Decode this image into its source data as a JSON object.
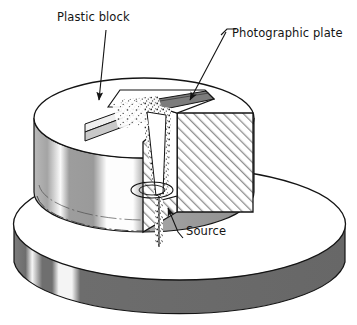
{
  "figure": {
    "width": 357,
    "height": 325,
    "background_color": "#ffffff",
    "line_color": "#141414"
  },
  "labels": [
    {
      "id": "plastic-block",
      "text": "Plastic block",
      "leader": "arrow",
      "points_to": "top face of upper cylindrical plastic block"
    },
    {
      "id": "photographic-plate",
      "text": "Photographic plate",
      "leader": "arrow",
      "points_to": "thin plate slab set into notch on top of block"
    },
    {
      "id": "source",
      "text": "Source",
      "leader": "arrow",
      "points_to": "small radioactive source at base of cut channel"
    }
  ],
  "parts": {
    "upper_block": {
      "name": "Plastic block",
      "shape": "cylinder",
      "face_color": "#fdfdfd",
      "side_color": "#9a9a9a",
      "highlight_color": "#fbfbfb"
    },
    "lower_platform": {
      "name": "Base platform",
      "shape": "cylinder",
      "face_color": "#fefefe",
      "side_color": "#6b6b6b",
      "highlight_color": "#f2f2f2"
    },
    "cutaway": {
      "name": "Sectioned quadrant",
      "fill": "hatched",
      "hatch_color": "#8c8c8c",
      "hatch_angle_deg": 45
    },
    "plate": {
      "name": "Photographic plate",
      "top_color": "#7d7d7d",
      "edge_color": "#d9d9d9"
    },
    "emission_cone": {
      "name": "Radiation stipple cone",
      "texture": "stipple",
      "dot_color": "#1f1f1f"
    }
  },
  "colors": {
    "ink": "#141414",
    "mid_gray": "#9a9a9a",
    "dark_gray": "#6b6b6b",
    "light_gray": "#d8d8d8",
    "hatch": "#8c8c8c",
    "white": "#ffffff"
  }
}
